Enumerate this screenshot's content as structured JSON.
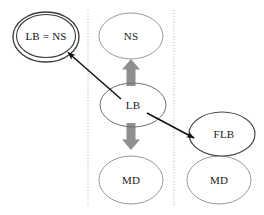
{
  "diagram": {
    "type": "node-ellipse-diagram",
    "background_color": "#ffffff",
    "columns": [
      {
        "name": "left-column"
      },
      {
        "name": "middle-column"
      },
      {
        "name": "right-column"
      }
    ],
    "dividers": [
      {
        "name": "divider-1",
        "style": "dotted",
        "color": "#b9b9b9",
        "x": 88
      },
      {
        "name": "divider-2",
        "style": "dotted",
        "color": "#b9b9b9",
        "x": 174
      }
    ],
    "nodes": [
      {
        "id": "lb-ns",
        "label": "LB = NS",
        "shape": "double-ellipse",
        "stroke": "#3a3a3a",
        "cx": 46,
        "cy": 37,
        "rx": 33,
        "ry": 25
      },
      {
        "id": "ns",
        "label": "NS",
        "shape": "ellipse",
        "stroke": "#9a9a9a",
        "cx": 131,
        "cy": 36,
        "rx": 32,
        "ry": 23
      },
      {
        "id": "lb",
        "label": "LB",
        "shape": "ellipse",
        "stroke": "#6e6e6e",
        "cx": 133,
        "cy": 105,
        "rx": 33,
        "ry": 22
      },
      {
        "id": "md-middle",
        "label": "MD",
        "shape": "ellipse",
        "stroke": "#9a9a9a",
        "cx": 131,
        "cy": 180,
        "rx": 32,
        "ry": 24
      },
      {
        "id": "flb",
        "label": "FLB",
        "shape": "ellipse",
        "stroke": "#4a4a4a",
        "cx": 222,
        "cy": 134,
        "rx": 33,
        "ry": 22
      },
      {
        "id": "md-right",
        "label": "MD",
        "shape": "ellipse",
        "stroke": "#9a9a9a",
        "cx": 219,
        "cy": 180,
        "rx": 32,
        "ry": 24
      }
    ],
    "arrows": [
      {
        "id": "arrow-lb-to-lbns",
        "style": "thin-line",
        "color": "#111111",
        "from": {
          "x": 121,
          "y": 99
        },
        "to": {
          "x": 66,
          "y": 51
        },
        "label": ""
      },
      {
        "id": "arrow-lb-to-flb",
        "style": "thin-line",
        "color": "#111111",
        "from": {
          "x": 147,
          "y": 113
        },
        "to": {
          "x": 196,
          "y": 139
        },
        "label": ""
      },
      {
        "id": "arrow-lb-up",
        "style": "block-arrow",
        "color": "#8f8f8f",
        "direction": "up",
        "x": 131,
        "from_y": 86,
        "to_y": 61
      },
      {
        "id": "arrow-lb-down",
        "style": "block-arrow",
        "color": "#8f8f8f",
        "direction": "down",
        "x": 131,
        "from_y": 124,
        "to_y": 149
      }
    ]
  }
}
